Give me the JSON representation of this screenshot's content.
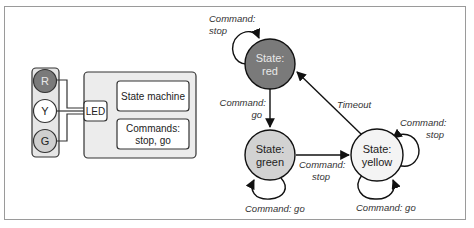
{
  "hardware": {
    "lights": [
      {
        "label": "R",
        "fill": "#7a7a7a",
        "text_color": "#e8e8e8"
      },
      {
        "label": "Y",
        "fill": "#ffffff",
        "text_color": "#222222"
      },
      {
        "label": "G",
        "fill": "#cfcfcf",
        "text_color": "#222222"
      }
    ],
    "led_label": "LED",
    "state_machine_label": "State machine",
    "commands_label_line1": "Commands:",
    "commands_label_line2": "stop, go"
  },
  "states": {
    "red": {
      "line1": "State:",
      "line2": "red",
      "fill": "#7a7a7a",
      "text_color": "#e8e8e8"
    },
    "green": {
      "line1": "State:",
      "line2": "green",
      "fill": "#d2d2d2",
      "text_color": "#222222"
    },
    "yellow": {
      "line1": "State:",
      "line2": "yellow",
      "fill": "#f4f4f4",
      "text_color": "#222222"
    }
  },
  "transitions": {
    "red_self_line1": "Command:",
    "red_self_line2": "stop",
    "red_to_green_line1": "Command:",
    "red_to_green_line2": "go",
    "yellow_to_red": "Timeout",
    "green_to_yellow_line1": "Command:",
    "green_to_yellow_line2": "stop",
    "green_self": "Command: go",
    "yellow_self_stop_line1": "Command:",
    "yellow_self_stop_line2": "stop",
    "yellow_self_go": "Command: go"
  }
}
